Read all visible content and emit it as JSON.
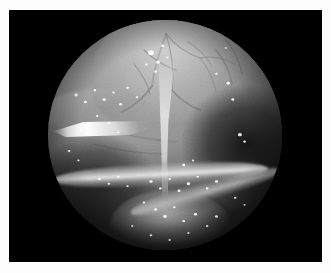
{
  "figure": {
    "modality": "Laparoscopic / endoscopic still photograph",
    "color_mode": "grayscale",
    "frame": {
      "page_background": "#ffffff",
      "plate_background": "#000000",
      "plate_rect": {
        "x": 9,
        "y": 10,
        "width": 313,
        "height": 252
      }
    },
    "scope_view": {
      "shape": "circle",
      "center_x": 156,
      "center_y": 125,
      "radius": 117,
      "rim_color": "#000000",
      "illumination": "bright upper-left-of-centre, vignetted to black at rim"
    },
    "tones": {
      "highlight": "#ffffff",
      "bright_tissue": "#c8c8c8",
      "mid_tissue": "#8e8e8e",
      "shadow_tissue": "#3c3c3c",
      "background": "#000000"
    },
    "structures": [
      {
        "name": "superior-tissue-mass",
        "label": "Superior lobulated tissue mass with vascular arborisation",
        "brightness": "bright"
      },
      {
        "name": "pedicle-stalk",
        "label": "Narrow pedicle descending from the mass",
        "brightness": "bright"
      },
      {
        "name": "horizontal-tube",
        "label": "Transverse tubular structure with specular highlight",
        "brightness": "bright"
      },
      {
        "name": "secondary-tube",
        "label": "Oblique secondary tubular fold",
        "brightness": "mid"
      },
      {
        "name": "inferior-fold",
        "label": "Inferior tissue fold",
        "brightness": "mid"
      },
      {
        "name": "instrument-highlight",
        "label": "Bright specular streak at left (instrument / tissue edge)",
        "brightness": "highlight"
      },
      {
        "name": "right-recess",
        "label": "Dark recess on the right side of the field",
        "brightness": "shadow"
      },
      {
        "name": "lower-left-recess",
        "label": "Dark recess at lower left",
        "brightness": "shadow"
      }
    ],
    "specular_highlights": [
      {
        "x": 44,
        "y": 14,
        "r": 2.4
      },
      {
        "x": 47,
        "y": 18,
        "r": 1.6
      },
      {
        "x": 49,
        "y": 11,
        "r": 1.3
      },
      {
        "x": 42,
        "y": 19,
        "r": 1.1
      },
      {
        "x": 51,
        "y": 16,
        "r": 1.0
      },
      {
        "x": 46,
        "y": 22,
        "r": 1.2
      },
      {
        "x": 12,
        "y": 32,
        "r": 1.5
      },
      {
        "x": 16,
        "y": 35,
        "r": 1.2
      },
      {
        "x": 20,
        "y": 30,
        "r": 1.1
      },
      {
        "x": 24,
        "y": 34,
        "r": 1.3
      },
      {
        "x": 28,
        "y": 31,
        "r": 1.0
      },
      {
        "x": 31,
        "y": 36,
        "r": 1.2
      },
      {
        "x": 34,
        "y": 29,
        "r": 1.1
      },
      {
        "x": 38,
        "y": 33,
        "r": 0.9
      },
      {
        "x": 21,
        "y": 41,
        "r": 1.0
      },
      {
        "x": 26,
        "y": 44,
        "r": 1.1
      },
      {
        "x": 14,
        "y": 47,
        "r": 0.9
      },
      {
        "x": 30,
        "y": 48,
        "r": 1.0
      },
      {
        "x": 9,
        "y": 56,
        "r": 1.1
      },
      {
        "x": 13,
        "y": 60,
        "r": 0.9
      },
      {
        "x": 77,
        "y": 27,
        "r": 1.4
      },
      {
        "x": 72,
        "y": 23,
        "r": 1.0
      },
      {
        "x": 79,
        "y": 34,
        "r": 1.2
      },
      {
        "x": 76,
        "y": 12,
        "r": 1.0
      },
      {
        "x": 90,
        "y": 11,
        "r": 1.3
      },
      {
        "x": 92,
        "y": 16,
        "r": 1.0
      },
      {
        "x": 82,
        "y": 49,
        "r": 1.6
      },
      {
        "x": 84,
        "y": 52,
        "r": 1.1
      },
      {
        "x": 22,
        "y": 68,
        "r": 1.2
      },
      {
        "x": 26,
        "y": 70,
        "r": 1.0
      },
      {
        "x": 30,
        "y": 67,
        "r": 1.1
      },
      {
        "x": 34,
        "y": 71,
        "r": 0.9
      },
      {
        "x": 44,
        "y": 69,
        "r": 1.3
      },
      {
        "x": 48,
        "y": 72,
        "r": 1.1
      },
      {
        "x": 52,
        "y": 68,
        "r": 1.0
      },
      {
        "x": 56,
        "y": 73,
        "r": 1.2
      },
      {
        "x": 60,
        "y": 70,
        "r": 1.4
      },
      {
        "x": 64,
        "y": 67,
        "r": 1.0
      },
      {
        "x": 68,
        "y": 72,
        "r": 1.1
      },
      {
        "x": 72,
        "y": 69,
        "r": 1.3
      },
      {
        "x": 58,
        "y": 62,
        "r": 1.2
      },
      {
        "x": 62,
        "y": 60,
        "r": 0.9
      },
      {
        "x": 41,
        "y": 78,
        "r": 1.0
      },
      {
        "x": 46,
        "y": 81,
        "r": 1.2
      },
      {
        "x": 50,
        "y": 84,
        "r": 1.4
      },
      {
        "x": 54,
        "y": 80,
        "r": 1.0
      },
      {
        "x": 58,
        "y": 86,
        "r": 1.1
      },
      {
        "x": 63,
        "y": 83,
        "r": 1.3
      },
      {
        "x": 68,
        "y": 88,
        "r": 1.0
      },
      {
        "x": 72,
        "y": 84,
        "r": 1.2
      },
      {
        "x": 36,
        "y": 88,
        "r": 0.9
      },
      {
        "x": 44,
        "y": 92,
        "r": 1.1
      },
      {
        "x": 52,
        "y": 94,
        "r": 1.0
      },
      {
        "x": 60,
        "y": 91,
        "r": 0.9
      },
      {
        "x": 80,
        "y": 76,
        "r": 1.0
      },
      {
        "x": 84,
        "y": 79,
        "r": 0.9
      }
    ],
    "vessel_paths": [
      "M 118 14 C 112 30, 106 48, 104 66",
      "M 118 14 C 128 26, 140 34, 152 38",
      "M 118 14 C 124 32, 126 52, 124 70",
      "M 104 66 C 96 78, 86 86, 74 92",
      "M 152 38 C 160 48, 166 60, 168 72",
      "M 152 38 C 164 36, 176 38, 186 44",
      "M 124 70 C 132 80, 142 86, 152 90",
      "M 96 30 C 106 40, 116 46, 128 50",
      "M 140 22 C 150 28, 158 36, 164 46",
      "M 168 30 C 176 40, 182 52, 184 64",
      "M 86 44 C 94 54, 100 64, 102 74",
      "M 178 20 C 186 30, 192 42, 194 54",
      "M 60 110 C 80 116, 104 120, 128 122",
      "M 46 124 C 68 130, 94 134, 118 134",
      "M 96 146 C 112 152, 130 156, 148 158"
    ]
  }
}
